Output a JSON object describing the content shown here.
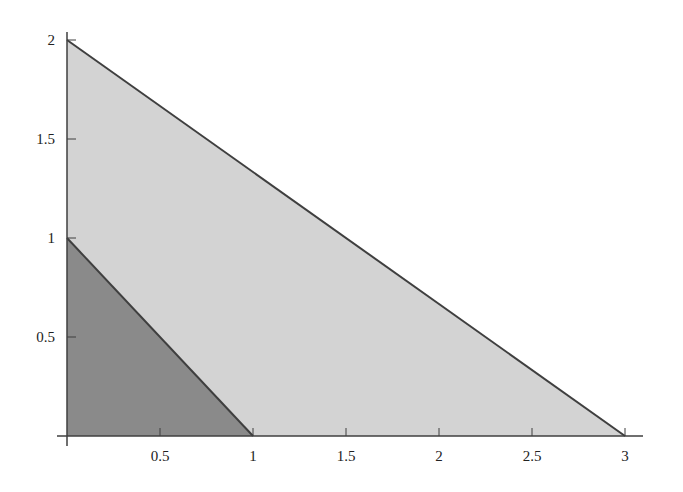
{
  "chart_data": {
    "type": "area",
    "title": "",
    "xlabel": "",
    "ylabel": "",
    "xlim": [
      0,
      3
    ],
    "ylim": [
      0,
      2
    ],
    "grid": false,
    "legend": null,
    "x_ticks": [
      "0.5",
      "1",
      "1.5",
      "2",
      "2.5",
      "3"
    ],
    "y_ticks": [
      "0.5",
      "1",
      "1.5",
      "2"
    ],
    "series": [
      {
        "name": "outer-region",
        "description": "Triangle bounded by axes and line from (0,2) to (3,0)",
        "vertices": [
          [
            0,
            0
          ],
          [
            0,
            2
          ],
          [
            3,
            0
          ]
        ],
        "fill": "#d3d3d3"
      },
      {
        "name": "inner-region",
        "description": "Triangle bounded by axes and line from (0,1) to (1,0)",
        "vertices": [
          [
            0,
            0
          ],
          [
            0,
            1
          ],
          [
            1,
            0
          ]
        ],
        "fill": "#8a8a8a"
      }
    ],
    "line_color": "#3f3f3f"
  }
}
